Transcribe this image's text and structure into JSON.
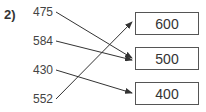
{
  "question": {
    "label": "2)"
  },
  "left_numbers": [
    {
      "value": "475"
    },
    {
      "value": "584"
    },
    {
      "value": "430"
    },
    {
      "value": "552"
    }
  ],
  "target_boxes": [
    {
      "value": "600"
    },
    {
      "value": "500"
    },
    {
      "value": "400"
    }
  ],
  "connections": [
    {
      "from": "475",
      "to": "500"
    },
    {
      "from": "584",
      "to": "500"
    },
    {
      "from": "430",
      "to": "400"
    },
    {
      "from": "552",
      "to": "600"
    }
  ],
  "colors": {
    "line": "#333333",
    "box_border": "#555555",
    "text": "#333333"
  }
}
